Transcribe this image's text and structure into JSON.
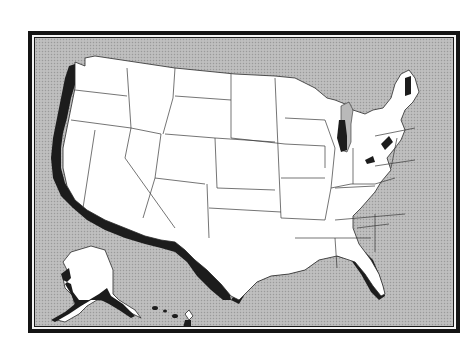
{
  "map": {
    "subject": "United States",
    "style": "outline map with state borders",
    "highlighted_regions": [
      "Pacific coast (Washington, Oregon, California)",
      "Gulf coast (Texas, Louisiana, Mississippi, Alabama, Florida)",
      "Lake Michigan shore",
      "Lake Ontario / Lake Champlain shore (New York)",
      "Lake Erie shore",
      "Western Maine",
      "Alaska southern coast",
      "Hawaii"
    ],
    "colors": {
      "background": "#b9b9b9",
      "land": "#ffffff",
      "highlight": "#1c1c1c",
      "frame": "#141414"
    }
  }
}
